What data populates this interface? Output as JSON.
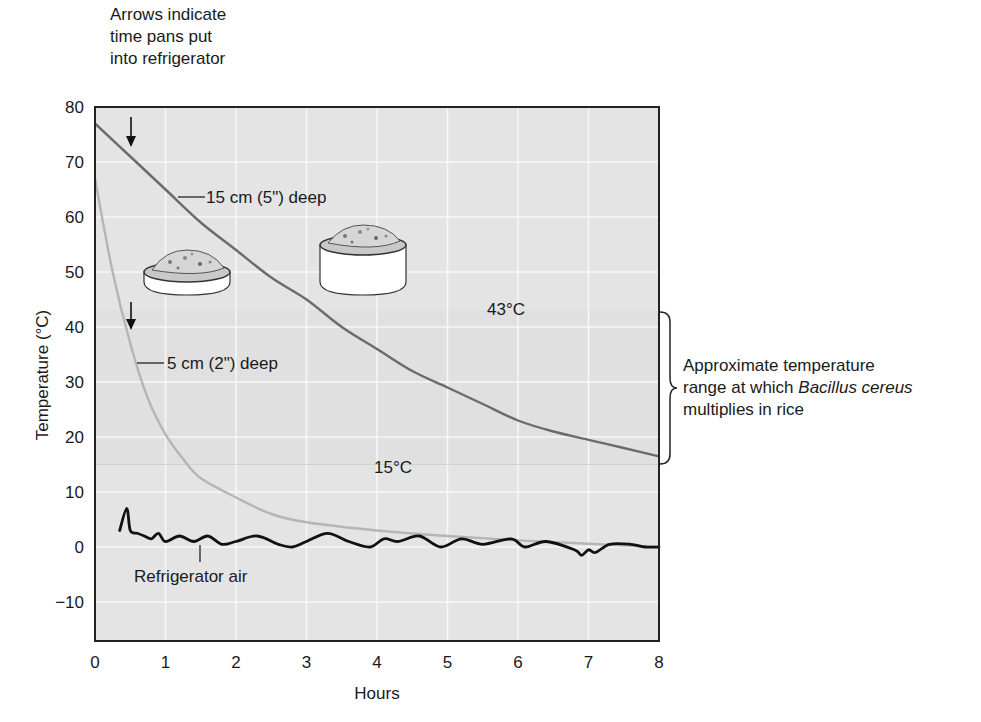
{
  "chart_data": {
    "type": "line",
    "title": "",
    "xlabel": "Hours",
    "ylabel": "Temperature (°C)",
    "xlim": [
      0,
      8
    ],
    "ylim": [
      -17,
      80
    ],
    "x_ticks": [
      "0",
      "1",
      "2",
      "3",
      "4",
      "5",
      "6",
      "7",
      "8"
    ],
    "y_ticks": [
      "80",
      "70",
      "60",
      "50",
      "40",
      "30",
      "20",
      "10",
      "0",
      "−10"
    ],
    "grid": true,
    "legend": null,
    "series": [
      {
        "name": "15 cm (5\") deep",
        "color": "#6b6b6b",
        "x": [
          0,
          0.5,
          1,
          1.5,
          2,
          2.5,
          3,
          3.5,
          4,
          4.5,
          5,
          5.5,
          6,
          6.5,
          7,
          7.5,
          8
        ],
        "values": [
          77,
          71,
          65,
          59,
          54,
          49,
          45,
          40,
          36,
          32,
          29,
          26,
          23,
          21,
          19.5,
          18,
          16.5
        ]
      },
      {
        "name": "5 cm (2\") deep",
        "color": "#b5b5b5",
        "x": [
          0,
          0.25,
          0.5,
          0.75,
          1,
          1.25,
          1.5,
          2,
          2.5,
          3,
          4,
          5,
          6,
          7,
          8
        ],
        "values": [
          67,
          50,
          37,
          27,
          20.5,
          16,
          12.5,
          9,
          6,
          4.5,
          3,
          2,
          1.2,
          0.6,
          0
        ]
      },
      {
        "name": "Refrigerator air",
        "color": "#111111",
        "x": [
          0.35,
          0.45,
          0.5,
          0.6,
          0.7,
          0.8,
          0.9,
          1.0,
          1.2,
          1.4,
          1.6,
          1.8,
          2.0,
          2.3,
          2.6,
          2.8,
          3.0,
          3.3,
          3.6,
          3.9,
          4.1,
          4.3,
          4.6,
          4.9,
          5.2,
          5.5,
          5.9,
          6.1,
          6.4,
          6.8,
          6.9,
          7.0,
          7.1,
          7.3,
          7.6,
          7.8,
          8.0
        ],
        "values": [
          3,
          7,
          3,
          2.5,
          2,
          1.5,
          2.5,
          1,
          2,
          1,
          2,
          0.5,
          1,
          2,
          0.5,
          0,
          1,
          2.5,
          1,
          0,
          1.5,
          1,
          2,
          0,
          1.5,
          0.5,
          1.5,
          0,
          1,
          -0.5,
          -1.5,
          -0.5,
          -1,
          0.5,
          0.5,
          0,
          0
        ]
      }
    ],
    "annotations": {
      "arrows_note": [
        "Arrows indicate",
        "time pans put",
        "into refrigerator"
      ],
      "arrow_15cm_hour": 0.5,
      "arrow_5cm_hour": 0.5,
      "label_15cm": "15 cm (5\") deep",
      "label_5cm": "5 cm (2\") deep",
      "label_air": "Refrigerator air",
      "band_upper_label": "43°C",
      "band_lower_label": "15°C",
      "band_range": [
        15,
        43
      ],
      "bracket_note_line1": "Approximate temperature",
      "bracket_note_line2_prefix": "range at which ",
      "bracket_note_line2_italic": "Bacillus cereus",
      "bracket_note_line3": "multiplies in rice"
    }
  }
}
